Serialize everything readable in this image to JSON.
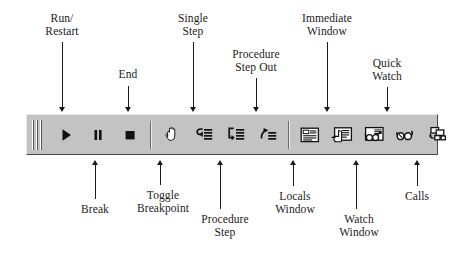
{
  "figure": {
    "toolbar_bg": "#c3c3c3",
    "ink": "#1b1b1b"
  },
  "toolbar": {
    "grip_name": "toolbar-drag-grip",
    "buttons": [
      {
        "id": "run",
        "label": "Run/\nRestart",
        "icon": "play-triangle-icon"
      },
      {
        "id": "break",
        "label": "Break",
        "icon": "pause-bars-icon"
      },
      {
        "id": "end",
        "label": "End",
        "icon": "stop-square-icon"
      },
      {
        "id": "toggle_breakpoint",
        "label": "Toggle\nBreakpoint",
        "icon": "hand-icon"
      },
      {
        "id": "single_step",
        "label": "Single\nStep",
        "icon": "step-into-arrow-lines-icon"
      },
      {
        "id": "procedure_step",
        "label": "Procedure\nStep",
        "icon": "step-over-arrow-lines-icon"
      },
      {
        "id": "procedure_step_out",
        "label": "Procedure\nStep Out",
        "icon": "step-out-arrow-lines-icon"
      },
      {
        "id": "locals_window",
        "label": "Locals\nWindow",
        "icon": "locals-window-icon"
      },
      {
        "id": "immediate_window",
        "label": "Immediate\nWindow",
        "icon": "immediate-window-hand-icon"
      },
      {
        "id": "watch_window",
        "label": "Watch\nWindow",
        "icon": "watch-window-glasses-icon"
      },
      {
        "id": "quick_watch",
        "label": "Quick\nWatch",
        "icon": "quick-watch-glasses-icon"
      },
      {
        "id": "calls",
        "label": "Calls",
        "icon": "calls-stack-boxes-icon"
      }
    ]
  },
  "callouts": {
    "above": [
      {
        "id": "run",
        "text": "Run/\nRestart"
      },
      {
        "id": "single_step",
        "text": "Single\nStep"
      },
      {
        "id": "procedure_step_out",
        "text": "Procedure\nStep Out"
      },
      {
        "id": "immediate_window",
        "text": "Immediate\nWindow"
      },
      {
        "id": "quick_watch",
        "text": "Quick\nWatch"
      },
      {
        "id": "end",
        "text": "End"
      }
    ],
    "below": [
      {
        "id": "break",
        "text": "Break"
      },
      {
        "id": "toggle_breakpoint",
        "text": "Toggle\nBreakpoint"
      },
      {
        "id": "procedure_step",
        "text": "Procedure\nStep"
      },
      {
        "id": "locals_window",
        "text": "Locals\nWindow"
      },
      {
        "id": "watch_window",
        "text": "Watch\nWindow"
      },
      {
        "id": "calls",
        "text": "Calls"
      }
    ]
  }
}
